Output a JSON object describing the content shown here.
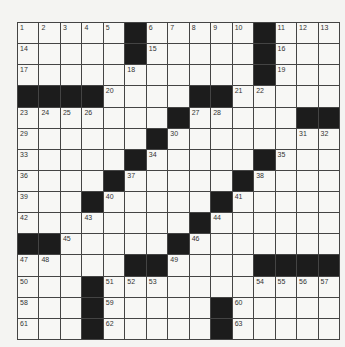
{
  "puzzle": {
    "size": 15,
    "rows": [
      [
        "1",
        "2",
        "3",
        "4",
        "5",
        "#",
        "6",
        "7",
        "8",
        "9",
        "10",
        "#",
        "11",
        "12",
        "13"
      ],
      [
        "14",
        ".",
        ".",
        ".",
        ".",
        "#",
        "15",
        ".",
        ".",
        ".",
        ".",
        "#",
        "16",
        ".",
        "."
      ],
      [
        "17",
        ".",
        ".",
        ".",
        ".",
        "18",
        ".",
        ".",
        ".",
        ".",
        ".",
        "#",
        "19",
        ".",
        "."
      ],
      [
        "#",
        "#",
        "#",
        "#",
        "20",
        ".",
        ".",
        ".",
        "#",
        "#",
        "21",
        "22",
        ".",
        ".",
        "."
      ],
      [
        "23",
        "24",
        "25",
        "26",
        ".",
        ".",
        ".",
        "#",
        "27",
        "28",
        ".",
        ".",
        ".",
        "#",
        "#"
      ],
      [
        "29",
        ".",
        ".",
        ".",
        ".",
        ".",
        "#",
        "30",
        ".",
        ".",
        ".",
        ".",
        ".",
        "31",
        "32"
      ],
      [
        "33",
        ".",
        ".",
        ".",
        ".",
        "#",
        "34",
        ".",
        ".",
        ".",
        ".",
        "#",
        "35",
        ".",
        "."
      ],
      [
        "36",
        ".",
        ".",
        ".",
        "#",
        "37",
        ".",
        ".",
        ".",
        ".",
        "#",
        "38",
        ".",
        ".",
        "."
      ],
      [
        "39",
        ".",
        ".",
        "#",
        "40",
        ".",
        ".",
        ".",
        ".",
        "#",
        "41",
        ".",
        ".",
        ".",
        "."
      ],
      [
        "42",
        ".",
        ".",
        "43",
        ".",
        ".",
        ".",
        ".",
        "#",
        "44",
        ".",
        ".",
        ".",
        ".",
        "."
      ],
      [
        "#",
        "#",
        "45",
        ".",
        ".",
        ".",
        ".",
        "#",
        "46",
        ".",
        ".",
        ".",
        ".",
        ".",
        "."
      ],
      [
        "47",
        "48",
        ".",
        ".",
        ".",
        "#",
        "#",
        "49",
        ".",
        ".",
        ".",
        "#",
        "#",
        "#",
        "#"
      ],
      [
        "50",
        ".",
        ".",
        "#",
        "51",
        "52",
        "53",
        ".",
        ".",
        ".",
        ".",
        "54",
        "55",
        "56",
        "57"
      ],
      [
        "58",
        ".",
        ".",
        "#",
        "59",
        ".",
        ".",
        ".",
        ".",
        "#",
        "60",
        ".",
        ".",
        ".",
        "."
      ],
      [
        "61",
        ".",
        ".",
        "#",
        "62",
        ".",
        ".",
        ".",
        ".",
        "#",
        "63",
        ".",
        ".",
        ".",
        "."
      ]
    ]
  },
  "colors": {
    "black_square": "#1c1c1c",
    "white_square": "#f7f7f5",
    "grid_line": "#444444"
  }
}
